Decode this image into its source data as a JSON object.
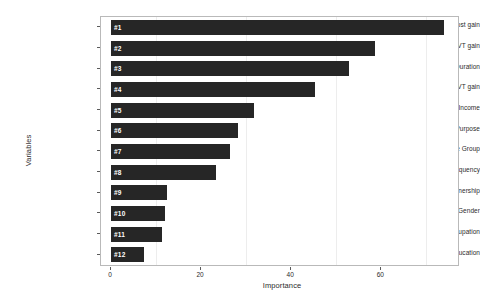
{
  "chart_data": {
    "type": "bar",
    "orientation": "horizontal",
    "title": "",
    "xlabel": "Importance",
    "ylabel": "Variables",
    "xlim": [
      0,
      76.8
    ],
    "xticks": [
      0,
      20,
      40,
      60
    ],
    "xtick_labels": [
      "0",
      "20",
      "40",
      "60"
    ],
    "grid": "minor-vertical",
    "legend": "none",
    "bar_color": "#262626",
    "bar_label_color": "#ffffff",
    "panel_border_color": "#b9b9b9",
    "background": "#ffffff",
    "categories": [
      "Cost gain",
      "IVT gain",
      "Trip Duration",
      "OVT gain",
      "Household Income",
      "Trip Purpose",
      "Age Group",
      "Trip Frequency",
      "Private Bike Ownership",
      "Gender",
      "Occupation",
      "Education"
    ],
    "values": [
      74.0,
      58.5,
      52.8,
      45.2,
      31.8,
      28.2,
      26.5,
      23.2,
      12.5,
      12.0,
      11.3,
      7.3
    ],
    "point_labels": [
      "#1",
      "#2",
      "#3",
      "#4",
      "#5",
      "#6",
      "#7",
      "#8",
      "#9",
      "#10",
      "#11",
      "#12"
    ],
    "bars": [
      {
        "rank": "#1",
        "category": "Cost gain",
        "value": 74.0
      },
      {
        "rank": "#2",
        "category": "IVT gain",
        "value": 58.5
      },
      {
        "rank": "#3",
        "category": "Trip Duration",
        "value": 52.8
      },
      {
        "rank": "#4",
        "category": "OVT gain",
        "value": 45.2
      },
      {
        "rank": "#5",
        "category": "Household Income",
        "value": 31.8
      },
      {
        "rank": "#6",
        "category": "Trip Purpose",
        "value": 28.2
      },
      {
        "rank": "#7",
        "category": "Age Group",
        "value": 26.5
      },
      {
        "rank": "#8",
        "category": "Trip Frequency",
        "value": 23.2
      },
      {
        "rank": "#9",
        "category": "Private Bike Ownership",
        "value": 12.5
      },
      {
        "rank": "#10",
        "category": "Gender",
        "value": 12.0
      },
      {
        "rank": "#11",
        "category": "Occupation",
        "value": 11.3
      },
      {
        "rank": "#12",
        "category": "Education",
        "value": 7.3
      }
    ]
  }
}
